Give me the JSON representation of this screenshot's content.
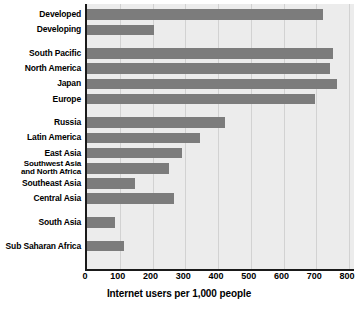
{
  "chart_data": {
    "type": "bar",
    "orientation": "horizontal",
    "title": "",
    "xlabel": "Internet users per 1,000 people",
    "ylabel": "",
    "xlim": [
      0,
      800
    ],
    "xticks": [
      0,
      100,
      200,
      300,
      400,
      500,
      600,
      700,
      800
    ],
    "xtick_labels": [
      "0",
      "100",
      "200",
      "300",
      "400",
      "500",
      "600",
      "700",
      "800"
    ],
    "grid": "vertical",
    "legend": "none",
    "bar_color": "#7c7c7c",
    "plot_background": "#ececec",
    "categories": [
      "Developed",
      "Developing",
      "South Pacific",
      "North America",
      "Japan",
      "Europe",
      "Russia",
      "Latin America",
      "East Asia",
      "Southwest Asia\nand North Africa",
      "Southeast Asia",
      "Central Asia",
      "South Asia",
      "Sub Saharan Africa"
    ],
    "values": [
      720,
      205,
      751,
      742,
      763,
      697,
      421,
      345,
      290,
      250,
      146,
      266,
      86,
      113
    ],
    "rows": [
      {
        "label": "Developed",
        "value": 720,
        "gap_after": false
      },
      {
        "label": "Developing",
        "value": 205,
        "gap_after": true
      },
      {
        "label": "South Pacific",
        "value": 751,
        "gap_after": false
      },
      {
        "label": "North America",
        "value": 742,
        "gap_after": false
      },
      {
        "label": "Japan",
        "value": 763,
        "gap_after": false
      },
      {
        "label": "Europe",
        "value": 697,
        "gap_after": true
      },
      {
        "label": "Russia",
        "value": 421,
        "gap_after": false
      },
      {
        "label": "Latin America",
        "value": 345,
        "gap_after": false
      },
      {
        "label": "East Asia",
        "value": 290,
        "gap_after": false
      },
      {
        "label": "Southwest Asia\nand North Africa",
        "value": 250,
        "gap_after": false
      },
      {
        "label": "Southeast Asia",
        "value": 146,
        "gap_after": false
      },
      {
        "label": "Central Asia",
        "value": 266,
        "gap_after": true
      },
      {
        "label": "South Asia",
        "value": 86,
        "gap_after": true
      },
      {
        "label": "Sub Saharan Africa",
        "value": 113,
        "gap_after": false
      }
    ]
  }
}
